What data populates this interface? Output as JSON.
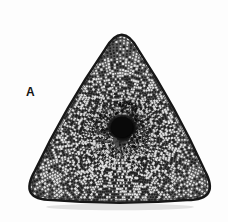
{
  "figure": {
    "kind": "light-micrograph",
    "panel_label": "A",
    "background_color": "#fdfdfd",
    "ink_color": "#141414"
  },
  "specimen": {
    "outline_shape": "rounded equilateral triangle",
    "orientation": "apex up",
    "apex_x": 122,
    "apex_y": 20,
    "bottom_left_x": 18,
    "bottom_left_y": 200,
    "bottom_right_x": 221,
    "bottom_right_y": 200,
    "corner_radius": 34,
    "margin_rim_color": "#171717",
    "margin_rim_width": 2.4,
    "areolae_fill_color": "#5a5a5a",
    "shadow_color": "#d8d8d8"
  },
  "central_area": {
    "name": "central annulus / rosette",
    "center_x": 122,
    "center_y": 127,
    "radius": 15,
    "color": "#090909"
  },
  "texture": {
    "name": "areolae",
    "pattern": "radial rows of square pores",
    "cell_size": 2.6,
    "row_count": 46,
    "ray_count": 168,
    "light_cell_color": "#e9e9e9",
    "dark_cell_color": "#1d1d1d"
  },
  "chart_data": {
    "type": "scatter",
    "title": "",
    "xlabel": "",
    "ylabel": ""
  }
}
